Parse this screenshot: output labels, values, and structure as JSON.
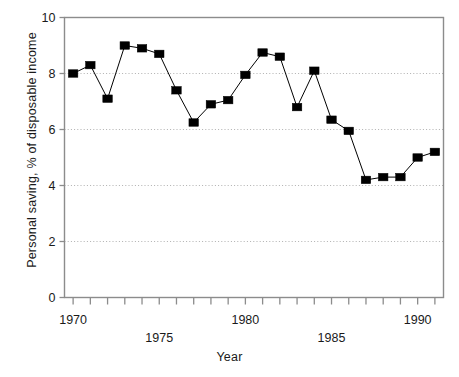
{
  "chart_data": {
    "type": "line",
    "title": "",
    "xlabel": "Year",
    "ylabel": "Personal saving, % of disposable income",
    "xlim": [
      1969.5,
      1991.5
    ],
    "ylim": [
      0,
      10
    ],
    "grid": true,
    "gridlines_y": [
      2,
      4,
      6,
      8
    ],
    "legend": "none",
    "marker": "filled-square",
    "line_color": "#000000",
    "marker_color": "#000000",
    "x": [
      1970,
      1971,
      1972,
      1973,
      1974,
      1975,
      1976,
      1977,
      1978,
      1979,
      1980,
      1981,
      1982,
      1983,
      1984,
      1985,
      1986,
      1987,
      1988,
      1989,
      1990,
      1991
    ],
    "values": [
      8.0,
      8.3,
      7.1,
      9.0,
      8.9,
      8.7,
      7.4,
      6.25,
      6.9,
      7.05,
      7.95,
      8.75,
      8.6,
      6.8,
      8.1,
      6.35,
      5.95,
      4.2,
      4.3,
      4.3,
      5.0,
      5.2
    ],
    "categories": [
      "1970",
      "1971",
      "1972",
      "1973",
      "1974",
      "1975",
      "1976",
      "1977",
      "1978",
      "1979",
      "1980",
      "1981",
      "1982",
      "1983",
      "1984",
      "1985",
      "1986",
      "1987",
      "1988",
      "1989",
      "1990",
      "1991"
    ],
    "x_tick_labels": [
      {
        "value": 1970,
        "label": "1970",
        "row": 0
      },
      {
        "value": 1975,
        "label": "1975",
        "row": 1
      },
      {
        "value": 1980,
        "label": "1980",
        "row": 0
      },
      {
        "value": 1985,
        "label": "1985",
        "row": 1
      },
      {
        "value": 1990,
        "label": "1990",
        "row": 0
      }
    ],
    "y_tick_labels": [
      "0",
      "2",
      "4",
      "6",
      "8",
      "10"
    ],
    "y_tick_values": [
      0,
      2,
      4,
      6,
      8,
      10
    ]
  },
  "axes": {
    "xlabel": "Year",
    "ylabel": "Personal saving, % of disposable income"
  },
  "colors": {
    "frame": "#8c8c8c",
    "grid": "#b0b0b0",
    "series": "#000000",
    "text": "#1a1a1a",
    "background": "#ffffff"
  }
}
